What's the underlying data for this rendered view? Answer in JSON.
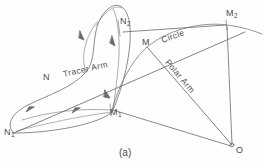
{
  "figure": {
    "caption": "(a)",
    "background_color": "#fefefe",
    "line_color": "#6b6b6b",
    "label_color": "#4a4a4a"
  },
  "points": [
    {
      "id": "N1",
      "label": "N",
      "subscript": "1",
      "x": 12,
      "y": 134
    },
    {
      "id": "N",
      "label": "N",
      "subscript": "",
      "x": 47,
      "y": 80
    },
    {
      "id": "N2",
      "label": "N",
      "subscript": "2",
      "x": 122,
      "y": 24
    },
    {
      "id": "M1",
      "label": "M",
      "subscript": "1",
      "x": 112,
      "y": 113
    },
    {
      "id": "M",
      "label": "M",
      "subscript": "",
      "x": 146,
      "y": 44
    },
    {
      "id": "M2",
      "label": "M",
      "subscript": "2",
      "x": 228,
      "y": 17
    },
    {
      "id": "O",
      "label": "O",
      "subscript": "",
      "x": 233,
      "y": 148
    }
  ],
  "annotations": [
    {
      "id": "tracer-arm",
      "text": "Tracer  Arm",
      "x": 64,
      "y": 78,
      "rotation": -13
    },
    {
      "id": "polar-arm",
      "text": "Polar  Arm",
      "x": 172,
      "y": 62,
      "rotation": 50
    },
    {
      "id": "circle",
      "text": "Circle",
      "x": 164,
      "y": 40,
      "rotation": -20
    }
  ],
  "geometry": {
    "tracer_arm_line": "M 14,133 L 245,32",
    "polar_arm_line": "M 147,47 L 232,145",
    "link_n2_m2": "M 123,32 L 226,25",
    "link_m2_o": "M 227,26 L 232,144",
    "link_m1_o": "M 113,110 L 231,146",
    "circle_arc": "M 112,110 C 118,88 130,62 147,47 C 172,27 205,22 227,25 C 243,27 254,31 262,34",
    "cam_outline": "M 14,133 C 6,126 10,114 28,105 C 48,95 72,88 86,72 C 96,61 92,40 98,24 C 103,11 112,3 120,6 C 130,10 132,30 129,52 C 126,76 118,98 113,110 C 108,121 60,133 14,133 Z",
    "cam_inner_1": "M 86,72 C 80,56 86,36 97,22",
    "cam_inner_2": "M 113,110 C 116,88 120,60 119,40 C 118,24 116,14 113,9",
    "cam_inner_3": "M 22,120 C 48,112 80,108 110,110",
    "arrows": [
      {
        "x": 82,
        "y": 36,
        "angle": 118
      },
      {
        "x": 114,
        "y": 42,
        "angle": 95
      },
      {
        "x": 107,
        "y": 96,
        "angle": 72
      },
      {
        "x": 30,
        "y": 110,
        "angle": 342
      },
      {
        "x": 76,
        "y": 111,
        "angle": 350
      }
    ]
  }
}
